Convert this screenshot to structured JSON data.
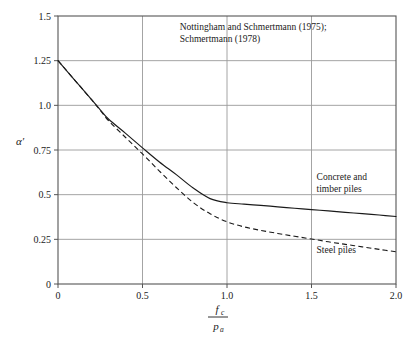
{
  "chart_data": {
    "type": "line",
    "title": "",
    "xlabel": "fc / pa",
    "xlabel_numerator": "f",
    "xlabel_numerator_sub": "c",
    "xlabel_denominator": "p",
    "xlabel_denominator_sub": "a",
    "ylabel": "α′",
    "xlim": [
      0,
      2.0
    ],
    "ylim": [
      0,
      1.5
    ],
    "grid": true,
    "legend_position": "inline-annotations",
    "xticks": [
      "0",
      "0.5",
      "1.0",
      "1.5",
      "2.0"
    ],
    "xtick_values": [
      0,
      0.5,
      1.0,
      1.5,
      2.0
    ],
    "yticks": [
      "0",
      "0.25",
      "0.5",
      "0.75",
      "1.0",
      "1.25",
      "1.5"
    ],
    "ytick_values": [
      0,
      0.25,
      0.5,
      0.75,
      1.0,
      1.25,
      1.5
    ],
    "annotations": [
      {
        "name": "source-citation",
        "line1": "Nottingham and Schmertmann (1975);",
        "line2": "Schmertmann (1978)",
        "x": 0.72,
        "y": 1.42
      }
    ],
    "series": [
      {
        "name": "Concrete and timber piles",
        "label_line1": "Concrete and",
        "label_line2": "timber piles",
        "style": "solid",
        "color": "#1a1a1a",
        "label_x": 1.53,
        "label_y": 0.58,
        "x": [
          0.0,
          0.1,
          0.2,
          0.25,
          0.3,
          0.4,
          0.5,
          0.6,
          0.7,
          0.8,
          0.9,
          1.0,
          1.1,
          1.2,
          1.3,
          1.4,
          1.5,
          1.6,
          1.7,
          1.8,
          1.9,
          2.0
        ],
        "y": [
          1.25,
          1.14,
          1.03,
          0.975,
          0.922,
          0.843,
          0.762,
          0.683,
          0.612,
          0.537,
          0.478,
          0.455,
          0.447,
          0.44,
          0.432,
          0.424,
          0.416,
          0.409,
          0.401,
          0.394,
          0.386,
          0.378
        ]
      },
      {
        "name": "Steel piles",
        "label_line1": "Steel piles",
        "label_line2": "",
        "style": "dashed",
        "color": "#1a1a1a",
        "label_x": 1.53,
        "label_y": 0.175,
        "x": [
          0.0,
          0.1,
          0.2,
          0.25,
          0.3,
          0.4,
          0.5,
          0.6,
          0.7,
          0.8,
          0.9,
          1.0,
          1.1,
          1.2,
          1.3,
          1.4,
          1.5,
          1.6,
          1.7,
          1.8,
          1.9,
          2.0
        ],
        "y": [
          1.25,
          1.14,
          1.03,
          0.972,
          0.913,
          0.82,
          0.728,
          0.632,
          0.54,
          0.456,
          0.393,
          0.348,
          0.32,
          0.3,
          0.283,
          0.267,
          0.252,
          0.236,
          0.222,
          0.208,
          0.194,
          0.18
        ]
      }
    ]
  },
  "style": {
    "axis_color": "#555555",
    "grid_color": "#9a9a9a",
    "curve_color": "#1a1a1a",
    "background": "#ffffff"
  }
}
